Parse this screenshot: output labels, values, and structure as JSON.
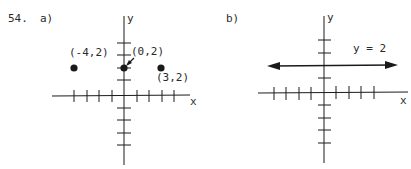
{
  "problem": {
    "number": "54.",
    "parts": [
      {
        "label": "a)",
        "axes": {
          "x_label": "x",
          "y_label": "y"
        },
        "points": [
          {
            "label": "(-4,2)",
            "x": -4,
            "y": 2
          },
          {
            "label": "(0,2)",
            "x": 0,
            "y": 2
          },
          {
            "label": "(3,2)",
            "x": 3,
            "y": 2
          }
        ]
      },
      {
        "label": "b)",
        "axes": {
          "x_label": "x",
          "y_label": "y"
        },
        "line": {
          "equation": "y = 2",
          "y": 2
        }
      }
    ]
  },
  "colors": {
    "ink": "#1a1a1a",
    "background": "#ffffff"
  }
}
